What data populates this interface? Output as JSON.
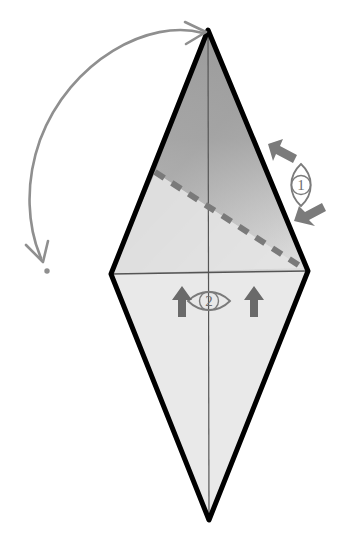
{
  "figure": {
    "background_color": "#ffffff"
  },
  "shape": {
    "name": "kite-polygon",
    "apex": {
      "x": 208,
      "y": 30
    },
    "left_vertex": {
      "x": 111,
      "y": 274
    },
    "right_vertex": {
      "x": 308,
      "y": 271
    },
    "bottom_vertex": {
      "x": 209,
      "y": 520
    },
    "outline_color": "#000000",
    "outline_width": 5,
    "lower_fill_color": "#e9e9e9",
    "upper_gradient_dark": "#949494",
    "upper_gradient_light": "#d8d8d8",
    "inner_line_color": "#555555",
    "inner_line_width": 1.2
  },
  "fold_line": {
    "name": "valley-fold-dashed-line",
    "start": {
      "x": 155,
      "y": 172
    },
    "end": {
      "x": 303,
      "y": 268
    },
    "color": "#7a7a7a",
    "width": 6,
    "dash": "11 9",
    "label": "valley fold"
  },
  "rotation_arrow": {
    "name": "curved-rotation-arrow",
    "color": "#8f8f8f",
    "width": 2.6,
    "start": {
      "x": 204,
      "y": 31
    },
    "end": {
      "x": 44,
      "y": 261
    },
    "head_start_direction": "right",
    "head_end_direction": "down",
    "end_dot": {
      "x": 47,
      "y": 270,
      "radius": 2.6
    },
    "label": "rotate / flip"
  },
  "markers": [
    {
      "id": "marker-1",
      "number": "1",
      "eye_orientation": "vertical",
      "center": {
        "x": 301,
        "y": 185
      },
      "eye_half_width": 13,
      "eye_half_height": 21,
      "outline_color": "#7b7b7b",
      "number_color": "#6e6e6e",
      "arrows": [
        {
          "name": "arrow-upper",
          "tip": {
            "x": 271,
            "y": 146
          },
          "tail": {
            "x": 300,
            "y": 161
          },
          "direction": "up-left",
          "color": "#7b7b7b"
        },
        {
          "name": "arrow-lower",
          "tip": {
            "x": 297,
            "y": 219
          },
          "tail": {
            "x": 328,
            "y": 206
          },
          "direction": "down-left",
          "color": "#7b7b7b"
        }
      ]
    },
    {
      "id": "marker-2",
      "number": "2",
      "eye_orientation": "horizontal",
      "center": {
        "x": 209,
        "y": 301
      },
      "eye_half_width": 21,
      "eye_half_height": 12,
      "outline_color": "#7b7b7b",
      "number_color": "#6e6e6e",
      "arrows": [
        {
          "name": "arrow-left",
          "tip": {
            "x": 182,
            "y": 288
          },
          "tail": {
            "x": 182,
            "y": 316
          },
          "direction": "up",
          "color": "#6a6a6a"
        },
        {
          "name": "arrow-right",
          "tip": {
            "x": 254,
            "y": 288
          },
          "tail": {
            "x": 254,
            "y": 316
          },
          "direction": "up",
          "color": "#6a6a6a"
        }
      ]
    }
  ],
  "inner_lines": [
    {
      "name": "horizontal-crease",
      "x1": 111,
      "y1": 274,
      "x2": 308,
      "y2": 271
    },
    {
      "name": "vertical-crease",
      "x1": 208,
      "y1": 30,
      "x2": 209,
      "y2": 520
    }
  ]
}
